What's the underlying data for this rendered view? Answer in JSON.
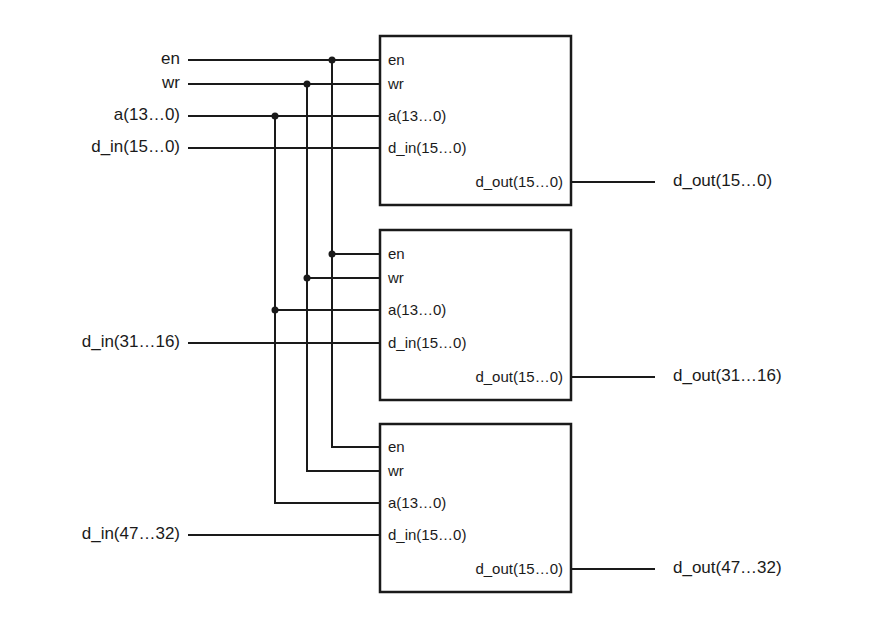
{
  "diagram": {
    "inputs": {
      "en": "en",
      "wr": "wr",
      "a": "a(13…0)",
      "d_in_0": "d_in(15…0)",
      "d_in_1": "d_in(31…16)",
      "d_in_2": "d_in(47…32)"
    },
    "outputs": {
      "d_out_0": "d_out(15…0)",
      "d_out_1": "d_out(31…16)",
      "d_out_2": "d_out(47…32)"
    },
    "block_pins": {
      "en": "en",
      "wr": "wr",
      "a": "a(13…0)",
      "d_in": "d_in(15…0)",
      "d_out": "d_out(15…0)"
    },
    "colors": {
      "line": "#1a1a1a",
      "background": "#ffffff"
    }
  }
}
